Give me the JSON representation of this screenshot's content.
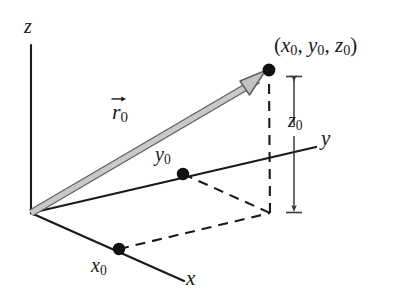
{
  "figure": {
    "type": "3d-cartesian-coordinate-diagram",
    "background_color": "#ffffff",
    "line_color": "#1a1a1a",
    "vector_color": "#b5b5b5",
    "vector_outline_color": "#6e6e6e",
    "dot_color": "#111111"
  },
  "axes": {
    "z_label": "z",
    "y_label": "y",
    "x_label": "x"
  },
  "labels": {
    "point": "(x₀, y₀, z₀)",
    "point_parts": {
      "open": "(",
      "x": "x",
      "x_sub": "0",
      "sep1": ", ",
      "y": "y",
      "y_sub": "0",
      "sep2": ", ",
      "z": "z",
      "z_sub": "0",
      "close": ")"
    },
    "vector": "r⃗₀",
    "vector_symbol": "r",
    "vector_sub": "0",
    "height_dimension": "z",
    "height_dimension_sub": "0",
    "y_intercept": "y",
    "y_intercept_sub": "0",
    "x_intercept": "x",
    "x_intercept_sub": "0"
  },
  "geometry": {
    "origin": [
      31,
      213
    ],
    "z_axis_tip": [
      31,
      45
    ],
    "y_axis_tip": [
      316,
      147
    ],
    "x_axis_tip": [
      184,
      281
    ],
    "point": [
      269,
      70
    ],
    "projection_xy": [
      270,
      213
    ],
    "y_intercept_point": [
      183,
      174
    ],
    "x_intercept_point": [
      119,
      249
    ],
    "z_dimension_x": 294,
    "z_dimension_top": 76,
    "z_dimension_bottom": 213
  }
}
